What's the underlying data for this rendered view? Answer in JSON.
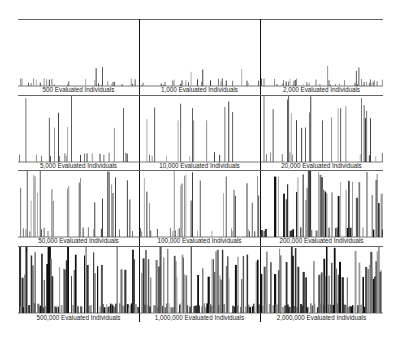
{
  "chart_data": {
    "type": "bar",
    "title": "",
    "layout": {
      "rows": 4,
      "cols": 3,
      "grid": false,
      "legend": "none"
    },
    "panels": [
      {
        "label": "500 Evaluated Individuals",
        "density": 0.35,
        "max_height": 0.55,
        "seed": 1
      },
      {
        "label": "1,000 Evaluated Individuals",
        "density": 0.3,
        "max_height": 0.75,
        "seed": 2
      },
      {
        "label": "2,000 Evaluated Individuals",
        "density": 0.35,
        "max_height": 0.7,
        "seed": 3
      },
      {
        "label": "5,000 Evaluated Individuals",
        "density": 0.2,
        "max_height": 1.0,
        "seed": 4
      },
      {
        "label": "10,000 Evaluated Individuals",
        "density": 0.22,
        "max_height": 1.0,
        "seed": 5
      },
      {
        "label": "20,000 Evaluated Individuals",
        "density": 0.28,
        "max_height": 1.0,
        "seed": 6
      },
      {
        "label": "50,000 Evaluated Individuals",
        "density": 0.3,
        "max_height": 1.0,
        "seed": 7
      },
      {
        "label": "100,000 Evaluated Individuals",
        "density": 0.45,
        "max_height": 1.0,
        "seed": 8
      },
      {
        "label": "200,000 Evaluated Individuals",
        "density": 0.55,
        "max_height": 1.0,
        "seed": 9
      },
      {
        "label": "500,000 Evaluated Individuals",
        "density": 0.75,
        "max_height": 1.0,
        "seed": 10
      },
      {
        "label": "1,000,000 Evaluated Individuals",
        "density": 0.85,
        "max_height": 1.0,
        "seed": 11
      },
      {
        "label": "2,000,000 Evaluated Individuals",
        "density": 0.85,
        "max_height": 1.0,
        "seed": 12
      }
    ],
    "xlabel": "",
    "ylabel": ""
  }
}
